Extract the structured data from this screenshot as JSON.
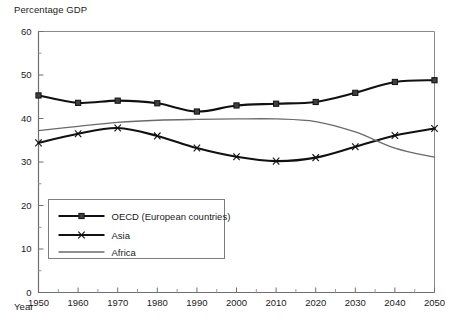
{
  "chart_data": {
    "type": "line",
    "title": "",
    "ylabel": "Percentage GDP",
    "xlabel": "Year",
    "x": [
      1950,
      1960,
      1970,
      1980,
      1990,
      2000,
      2010,
      2020,
      2030,
      2040,
      2050
    ],
    "xlim": [
      1950,
      2050
    ],
    "ylim": [
      0,
      60
    ],
    "xticks": [
      "1950",
      "1960",
      "1970",
      "1980",
      "1990",
      "2000",
      "2010",
      "2020",
      "2030",
      "2040",
      "2050"
    ],
    "yticks": [
      "0",
      "10",
      "20",
      "30",
      "40",
      "50",
      "60"
    ],
    "grid": false,
    "legend_position": "lower-left-inside",
    "minor_ticks": true,
    "series": [
      {
        "name": "OECD (European countries)",
        "marker": "square",
        "color": "#111111",
        "values": [
          45.3,
          43.6,
          44.1,
          43.5,
          41.6,
          43.0,
          43.4,
          43.8,
          45.9,
          48.4,
          48.8
        ]
      },
      {
        "name": "Asia",
        "marker": "cross",
        "color": "#111111",
        "values": [
          34.4,
          36.5,
          37.8,
          36.0,
          33.2,
          31.2,
          30.2,
          31.0,
          33.5,
          36.1,
          37.7
        ]
      },
      {
        "name": "Africa",
        "marker": "none",
        "color": "#6a6a6a",
        "values": [
          37.2,
          38.2,
          39.1,
          39.6,
          39.8,
          39.9,
          39.9,
          39.3,
          36.9,
          33.2,
          31.1
        ]
      }
    ]
  },
  "legend": {
    "entries": [
      {
        "label": "OECD (European countries)"
      },
      {
        "label": "Asia"
      },
      {
        "label": "Africa"
      }
    ]
  }
}
